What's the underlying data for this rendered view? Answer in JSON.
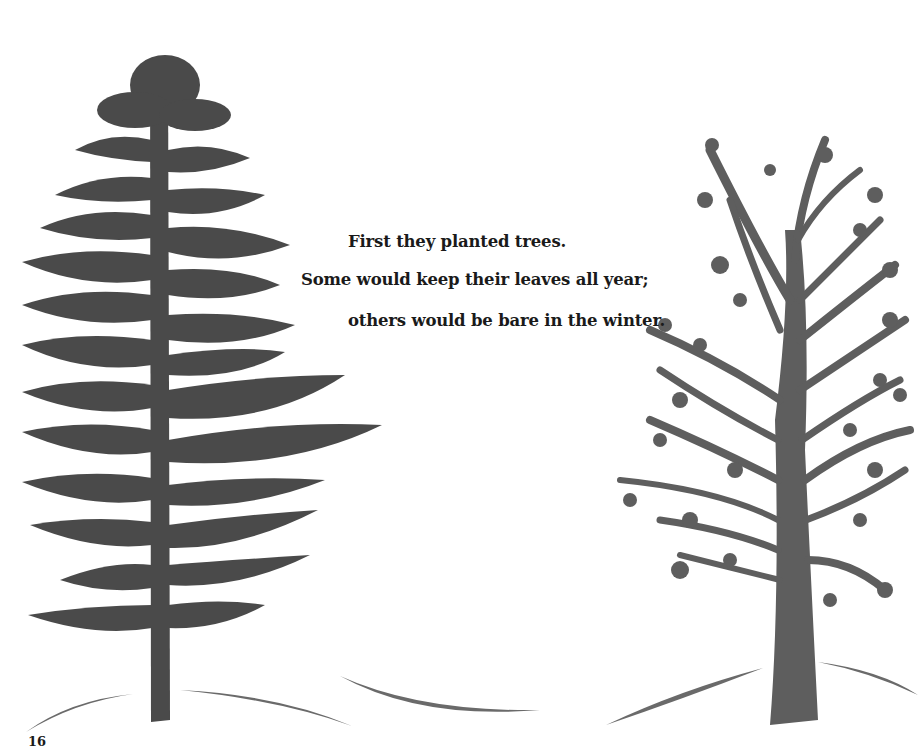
{
  "page": {
    "verse_lines": [
      "First they planted trees.",
      "Some would keep their leaves all year;",
      "others would be bare in the winter."
    ],
    "page_number": "16"
  },
  "illustration": {
    "left_tree": "evergreen-tree",
    "right_tree": "deciduous-tree",
    "ground": "hill-curves",
    "colors": {
      "evergreen": "#4a4a4a",
      "deciduous": "#5e5e5e",
      "ground": "#6a6a6a",
      "text": "#1a1a1a",
      "background": "#ffffff"
    }
  }
}
